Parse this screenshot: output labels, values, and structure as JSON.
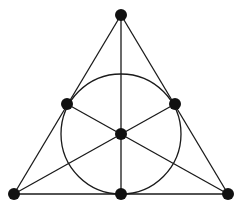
{
  "diagram": {
    "type": "fano-plane",
    "background": "#ffffff",
    "stroke_color": "#1a1a1a",
    "point_color": "#111111",
    "points": [
      {
        "id": "top",
        "x": 121,
        "y": 15
      },
      {
        "id": "left-mid",
        "x": 67,
        "y": 104
      },
      {
        "id": "right-mid",
        "x": 175,
        "y": 104
      },
      {
        "id": "center",
        "x": 121,
        "y": 134
      },
      {
        "id": "bottom-left",
        "x": 14,
        "y": 194
      },
      {
        "id": "bottom-mid",
        "x": 121,
        "y": 194
      },
      {
        "id": "bottom-right",
        "x": 228,
        "y": 194
      }
    ],
    "lines": [
      [
        "top",
        "bottom-left"
      ],
      [
        "top",
        "bottom-right"
      ],
      [
        "bottom-left",
        "bottom-right"
      ],
      [
        "top",
        "bottom-mid"
      ],
      [
        "left-mid",
        "bottom-right"
      ],
      [
        "right-mid",
        "bottom-left"
      ]
    ],
    "circle": {
      "cx": 121,
      "cy": 134,
      "r": 60
    }
  }
}
